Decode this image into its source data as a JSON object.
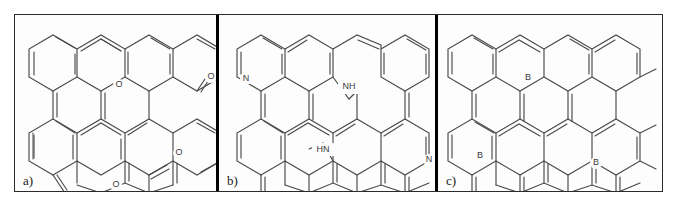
{
  "figure": {
    "background_color": "#ffffff",
    "frame_color": "#2b2b2b",
    "bond_color": "#4a4a4a",
    "divider_color": "#000000",
    "panel_count": 3
  },
  "panels": [
    {
      "id": "a",
      "label": "a)",
      "description": "Oxygen-doped polycyclic aromatic hydrocarbon with pyran ether bridges and ketone carbonyl groups",
      "heteroatoms": [
        "O",
        "O",
        "O",
        "O"
      ],
      "atom_labels": [
        {
          "text": "O",
          "name": "oxygen-ether-top",
          "x": 104,
          "y": 70
        },
        {
          "text": "O",
          "name": "oxygen-carbonyl-mid",
          "x": 164,
          "y": 138
        },
        {
          "text": "O",
          "name": "oxygen-ether-bottom",
          "x": 101,
          "y": 180
        },
        {
          "text": "O",
          "name": "oxygen-carbonyl-right",
          "x": 196,
          "y": 68
        }
      ]
    },
    {
      "id": "b",
      "label": "b)",
      "description": "Nitrogen-doped polycyclic aromatic hydrocarbon with pyridinic N and pyrrolic NH groups",
      "heteroatoms": [
        "N",
        "NH",
        "HN",
        "N"
      ],
      "atom_labels": [
        {
          "text": "N",
          "name": "nitrogen-pyridinic-left",
          "x": 27,
          "y": 64
        },
        {
          "text": "NH",
          "name": "nitrogen-pyrrolic-upper",
          "x": 129,
          "y": 72
        },
        {
          "text": "HN",
          "name": "nitrogen-pyrrolic-lower",
          "x": 112,
          "y": 135
        },
        {
          "text": "N",
          "name": "nitrogen-pyridinic-right",
          "x": 210,
          "y": 145
        }
      ]
    },
    {
      "id": "c",
      "label": "c)",
      "description": "Boron-doped nanographene with three substitutional boron centers in a hexagonal lattice",
      "heteroatoms": [
        "B",
        "B",
        "B"
      ],
      "atom_labels": [
        {
          "text": "B",
          "name": "boron-top-center",
          "x": 90,
          "y": 63
        },
        {
          "text": "B",
          "name": "boron-lower-left",
          "x": 48,
          "y": 141
        },
        {
          "text": "B",
          "name": "boron-lower-right",
          "x": 158,
          "y": 148
        }
      ]
    }
  ],
  "colors": {
    "bond": "#4a4a4a",
    "atom_text": "#3a3a3a",
    "panel_label": "#1a1a1a",
    "border": "#2b2b2b",
    "divider": "#000000",
    "background": "#ffffff"
  }
}
